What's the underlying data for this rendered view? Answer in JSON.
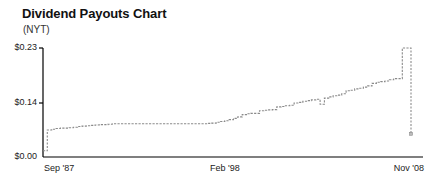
{
  "chart_data": {
    "type": "line",
    "title": "Dividend Payouts Chart",
    "subtitle": "(NYT)",
    "xlabel": "",
    "ylabel": "",
    "ylim": [
      0.0,
      0.23
    ],
    "grid": false,
    "legend": "none",
    "y_ticks": [
      {
        "value": 0.23,
        "label": "$0.23"
      },
      {
        "value": 0.14,
        "label": "$0.14"
      },
      {
        "value": 0.0,
        "label": "$0.00"
      }
    ],
    "x_ticks": [
      {
        "label": "Sep '87",
        "position": 0.0
      },
      {
        "label": "Feb '98",
        "position": 0.5
      },
      {
        "label": "Nov '08",
        "position": 1.0
      }
    ],
    "series": [
      {
        "name": "Dividend per share",
        "color": "#8a8a8a",
        "x": [
          "Sep '87",
          "Dec '87",
          "Mar '88",
          "Jun '88",
          "Sep '88",
          "Dec '88",
          "Mar '89",
          "Jun '89",
          "Sep '89",
          "Dec '89",
          "Mar '90",
          "Jun '90",
          "Sep '90",
          "Dec '90",
          "Mar '91",
          "Jun '91",
          "Sep '91",
          "Dec '91",
          "Mar '92",
          "Jun '92",
          "Sep '92",
          "Dec '92",
          "Mar '93",
          "Jun '93",
          "Sep '93",
          "Dec '93",
          "Mar '94",
          "Jun '94",
          "Sep '94",
          "Dec '94",
          "Mar '95",
          "Jun '95",
          "Sep '95",
          "Dec '95",
          "Mar '96",
          "Jun '96",
          "Sep '96",
          "Dec '96",
          "Mar '97",
          "Jun '97",
          "Sep '97",
          "Dec '97",
          "Feb '98",
          "Jun '98",
          "Sep '98",
          "Dec '98",
          "Mar '99",
          "Jun '99",
          "Sep '99",
          "Dec '99",
          "Mar '00",
          "Jun '00",
          "Sep '00",
          "Dec '00",
          "Mar '01",
          "Jun '01",
          "Sep '01",
          "Dec '01",
          "Mar '02",
          "Jun '02",
          "Sep '02",
          "Dec '02",
          "Mar '03",
          "Jun '03",
          "Sep '03",
          "Dec '03",
          "Mar '04",
          "Jun '04",
          "Sep '04",
          "Dec '04",
          "Mar '05",
          "Jun '05",
          "Sep '05",
          "Dec '05",
          "Mar '06",
          "Jun '06",
          "Sep '06",
          "Dec '06",
          "Mar '07",
          "Jun '07",
          "Sep '07",
          "Dec '07",
          "Mar '08",
          "Jun '08",
          "Sep '08",
          "Nov '08"
        ],
        "values": [
          0.016,
          0.07,
          0.072,
          0.074,
          0.075,
          0.075,
          0.076,
          0.077,
          0.079,
          0.08,
          0.081,
          0.082,
          0.083,
          0.084,
          0.084,
          0.085,
          0.086,
          0.086,
          0.086,
          0.086,
          0.086,
          0.086,
          0.086,
          0.086,
          0.086,
          0.086,
          0.086,
          0.086,
          0.086,
          0.086,
          0.086,
          0.086,
          0.086,
          0.086,
          0.086,
          0.086,
          0.086,
          0.086,
          0.087,
          0.088,
          0.09,
          0.092,
          0.094,
          0.097,
          0.1,
          0.104,
          0.11,
          0.112,
          0.113,
          0.113,
          0.12,
          0.121,
          0.122,
          0.123,
          0.13,
          0.131,
          0.133,
          0.134,
          0.14,
          0.141,
          0.143,
          0.144,
          0.145,
          0.146,
          0.137,
          0.148,
          0.15,
          0.152,
          0.153,
          0.155,
          0.16,
          0.161,
          0.163,
          0.164,
          0.166,
          0.168,
          0.172,
          0.174,
          0.175,
          0.176,
          0.178,
          0.18,
          0.18,
          0.23,
          0.23,
          0.06
        ]
      }
    ],
    "annotations": []
  },
  "axis": {
    "line_color": "#000000",
    "line_width": 1.2
  }
}
